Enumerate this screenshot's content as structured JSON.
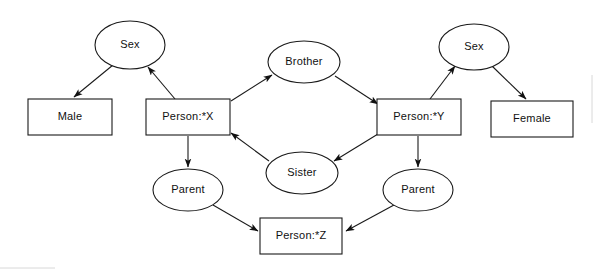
{
  "diagram": {
    "stroke_color": "#1a1a1a",
    "fill_color": "#ffffff",
    "frame_color": "#d8d8d8",
    "nodes": [
      {
        "id": "sex_left",
        "label": "Sex",
        "shape": "ellipse",
        "cx": 130,
        "cy": 45,
        "rx": 35,
        "ry": 24
      },
      {
        "id": "male",
        "label": "Male",
        "shape": "rect",
        "cx": 70,
        "cy": 117,
        "w": 84,
        "h": 36
      },
      {
        "id": "person_x",
        "label": "Person:*X",
        "shape": "rect",
        "cx": 188,
        "cy": 117,
        "w": 84,
        "h": 36
      },
      {
        "id": "brother",
        "label": "Brother",
        "shape": "ellipse",
        "cx": 304,
        "cy": 62,
        "rx": 36,
        "ry": 21
      },
      {
        "id": "sister",
        "label": "Sister",
        "shape": "ellipse",
        "cx": 302,
        "cy": 173,
        "rx": 36,
        "ry": 21
      },
      {
        "id": "person_y",
        "label": "Person:*Y",
        "shape": "rect",
        "cx": 419,
        "cy": 117,
        "w": 84,
        "h": 36
      },
      {
        "id": "sex_right",
        "label": "Sex",
        "shape": "ellipse",
        "cx": 474,
        "cy": 47,
        "rx": 35,
        "ry": 23
      },
      {
        "id": "female",
        "label": "Female",
        "shape": "rect",
        "cx": 532,
        "cy": 119,
        "w": 82,
        "h": 36
      },
      {
        "id": "parent_left",
        "label": "Parent",
        "shape": "ellipse",
        "cx": 188,
        "cy": 190,
        "rx": 35,
        "ry": 21
      },
      {
        "id": "parent_right",
        "label": "Parent",
        "shape": "ellipse",
        "cx": 418,
        "cy": 190,
        "rx": 35,
        "ry": 21
      },
      {
        "id": "person_z",
        "label": "Person:*Z",
        "shape": "rect",
        "cx": 301,
        "cy": 236,
        "w": 82,
        "h": 36
      }
    ],
    "edges": [
      {
        "id": "e1",
        "from": "sex_left",
        "to": "male",
        "x1": 113,
        "y1": 65,
        "x2": 74,
        "y2": 97
      },
      {
        "id": "e2",
        "from": "person_x",
        "to": "sex_left",
        "x1": 175,
        "y1": 99,
        "x2": 148,
        "y2": 67
      },
      {
        "id": "e3",
        "from": "person_x",
        "to": "brother",
        "x1": 231,
        "y1": 101,
        "x2": 272,
        "y2": 75
      },
      {
        "id": "e4",
        "from": "brother",
        "to": "person_y",
        "x1": 335,
        "y1": 76,
        "x2": 378,
        "y2": 104
      },
      {
        "id": "e5",
        "from": "person_y",
        "to": "sister",
        "x1": 378,
        "y1": 134,
        "x2": 334,
        "y2": 161
      },
      {
        "id": "e6",
        "from": "sister",
        "to": "person_x",
        "x1": 269,
        "y1": 161,
        "x2": 231,
        "y2": 133
      },
      {
        "id": "e7",
        "from": "person_y",
        "to": "sex_right",
        "x1": 430,
        "y1": 99,
        "x2": 455,
        "y2": 66
      },
      {
        "id": "e8",
        "from": "sex_right",
        "to": "female",
        "x1": 492,
        "y1": 66,
        "x2": 526,
        "y2": 99
      },
      {
        "id": "e9",
        "from": "person_x",
        "to": "parent_left",
        "x1": 188,
        "y1": 136,
        "x2": 188,
        "y2": 167
      },
      {
        "id": "e10",
        "from": "parent_left",
        "to": "person_z",
        "x1": 213,
        "y1": 205,
        "x2": 258,
        "y2": 231
      },
      {
        "id": "e11",
        "from": "person_y",
        "to": "parent_right",
        "x1": 418,
        "y1": 136,
        "x2": 418,
        "y2": 167
      },
      {
        "id": "e12",
        "from": "parent_right",
        "to": "person_z",
        "x1": 394,
        "y1": 205,
        "x2": 346,
        "y2": 231
      }
    ],
    "frame": {
      "right_line": {
        "x": 592,
        "y1": 75,
        "y2": 123
      },
      "bottom_line": {
        "y": 268,
        "x1": 0,
        "x2": 55
      }
    }
  }
}
